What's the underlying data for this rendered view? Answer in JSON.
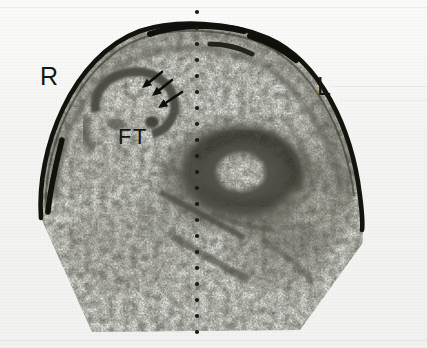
{
  "figure": {
    "modality": "cranial-ultrasound-coronal-scan",
    "background_color": "#f4f4f2",
    "ink_color": "#16160f",
    "width": 427,
    "height": 348
  },
  "annotations": {
    "right_marker": "R",
    "left_marker": "L",
    "lesion_label": "FT",
    "arrow_count": 3,
    "arrow_description": "three solid arrowheads pointing down-left at the right frontal echogenic rim",
    "midline_marker": "dotted vertical midline"
  },
  "labels": [
    {
      "name": "right-side-marker",
      "text": "R",
      "x": 40,
      "y": 64
    },
    {
      "name": "left-side-marker",
      "text": "L",
      "x": 317,
      "y": 74
    },
    {
      "name": "lesion-marker",
      "text": "FT",
      "x": 118,
      "y": 126
    }
  ],
  "midline": {
    "x": 197,
    "y_start": 12,
    "y_end": 344,
    "dot_radius": 2.1,
    "dot_spacing": 16,
    "color": "#1a1a14"
  },
  "arrows": [
    {
      "name": "arrow-1",
      "x1": 162,
      "y1": 72,
      "x2": 142,
      "y2": 88
    },
    {
      "name": "arrow-2",
      "x1": 172,
      "y1": 80,
      "x2": 152,
      "y2": 96
    },
    {
      "name": "arrow-3",
      "x1": 182,
      "y1": 92,
      "x2": 158,
      "y2": 108
    }
  ],
  "chart_data": {
    "type": "heatmap",
    "title": "",
    "xlabel": "",
    "ylabel": ""
  }
}
